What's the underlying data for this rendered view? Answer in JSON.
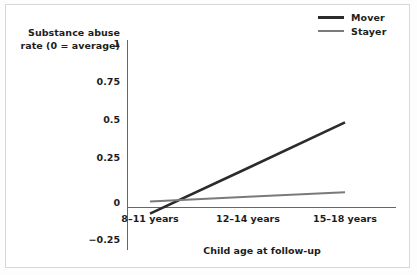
{
  "chart_data": {
    "type": "line",
    "title": "",
    "xlabel": "Child age at follow-up",
    "ylabel": "Substance abuse rate (0 = average)",
    "ylabel_line1": "Substance abuse",
    "ylabel_line2": "rate (0 = average)",
    "categories": [
      "8–11 years",
      "12–14 years",
      "15–18 years"
    ],
    "yticks": [
      "1",
      "0.75",
      "0.5",
      "0.25",
      "0",
      "−0.25"
    ],
    "ytick_values": [
      1,
      0.75,
      0.5,
      0.25,
      0,
      -0.25
    ],
    "ylim": [
      -0.25,
      1
    ],
    "grid": false,
    "legend_position": "top-right",
    "zero_reference_line": true,
    "series": [
      {
        "name": "Mover",
        "color": "#2b2b2b",
        "width": 2.6,
        "values": [
          -0.04,
          0.26,
          0.56
        ]
      },
      {
        "name": "Stayer",
        "color": "#7a7a7a",
        "width": 2.0,
        "values": [
          0.04,
          0.07,
          0.1
        ]
      }
    ]
  },
  "legend": {
    "items": [
      {
        "label": "Mover"
      },
      {
        "label": "Stayer"
      }
    ]
  },
  "colors": {
    "mover": "#2b2b2b",
    "stayer": "#7a7a7a",
    "axis": "#666666",
    "text": "#1d1d1d",
    "frame": "#d8d8d8",
    "background": "#ffffff"
  }
}
